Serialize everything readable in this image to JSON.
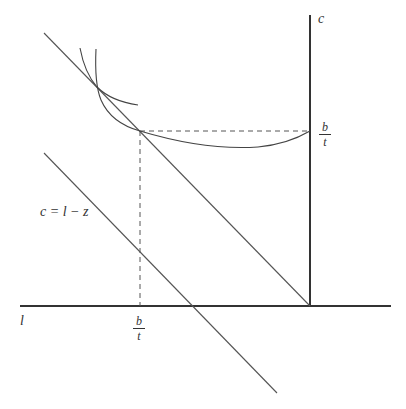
{
  "diagram": {
    "type": "economics-labor-leisure",
    "axes": {
      "horizontal_label": "l",
      "vertical_label": "c"
    },
    "labels": {
      "budget_line": "c = l − z",
      "c_axis_tick": {
        "numerator": "b",
        "denominator": "t"
      },
      "l_axis_tick": {
        "numerator": "b",
        "denominator": "t"
      }
    },
    "elements": [
      "upper budget line (diagonal)",
      "lower budget line c = l - z (diagonal)",
      "two indifference curves crossing on upper budget line",
      "indifference curve tangent at kink point (b/t, b/t)",
      "dashed projection lines to both axes"
    ],
    "colors": {
      "line": "#444444",
      "axis": "#333333",
      "background": "#ffffff"
    }
  }
}
